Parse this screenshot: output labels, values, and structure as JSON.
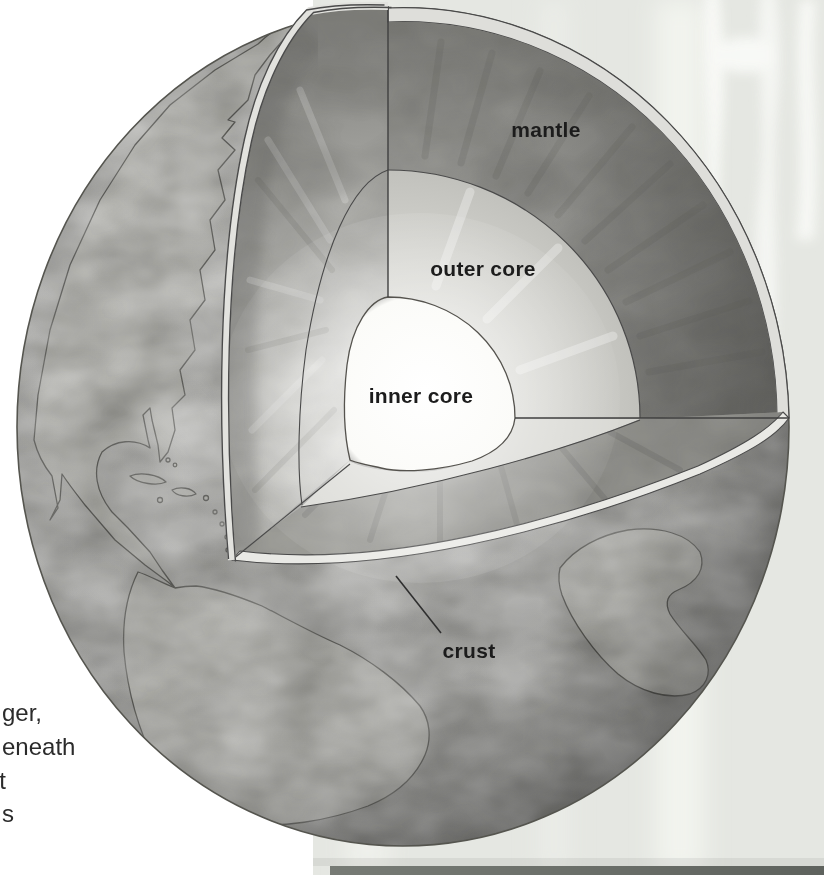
{
  "figure": {
    "type": "earth-interior-cutaway-diagram",
    "labels": {
      "mantle": "mantle",
      "outer_core": "outer core",
      "inner_core": "inner core",
      "crust": "crust"
    },
    "caption_fragments": [
      "ger,",
      "eneath",
      "t",
      "s"
    ],
    "colors": {
      "page_background": "#ffffff",
      "side_panel": "#e5e7e2",
      "bottom_strip": "#6d716b",
      "ocean": "#a8a8a5",
      "land": "#b2b2ad",
      "mantle_face": "#8e8e8a",
      "outer_core_face": "#cfcfca",
      "inner_core": "#fdfdfa",
      "crust_band": "#e9e9e5",
      "outline": "#4a4a4a",
      "label_text": "#1c1c1c"
    }
  }
}
